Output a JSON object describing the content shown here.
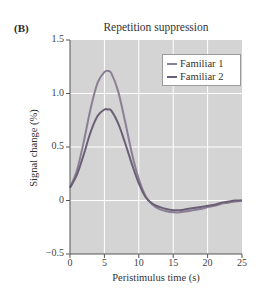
{
  "panel_label": "(B)",
  "chart_data": {
    "type": "line",
    "title": "Repetition suppression",
    "xlabel": "Peristimulus time (s)",
    "ylabel": "Signal change (%)",
    "xlim": [
      0,
      25
    ],
    "ylim": [
      -0.5,
      1.5
    ],
    "x_ticks": [
      0,
      5,
      10,
      15,
      20,
      25
    ],
    "x_tick_labels": [
      "0",
      "5",
      "10",
      "15",
      "20",
      "25"
    ],
    "y_ticks": [
      -0.5,
      0,
      0.5,
      1.0,
      1.5
    ],
    "y_tick_labels": [
      "−0.5",
      "0",
      "0.5",
      "1.0",
      "1.5"
    ],
    "grid": true,
    "background": "#d4d4d4",
    "grid_color": "#ffffff",
    "legend_position": "upper right",
    "x": [
      0,
      1,
      2,
      3,
      4,
      5,
      5.5,
      6,
      7,
      8,
      9,
      10,
      11,
      12,
      13,
      14,
      15,
      16,
      17,
      18,
      19,
      20,
      21,
      22,
      23,
      24,
      25
    ],
    "series": [
      {
        "name": "Familiar 1",
        "color": "#8a7f94",
        "values": [
          0.12,
          0.28,
          0.55,
          0.86,
          1.1,
          1.2,
          1.21,
          1.19,
          1.02,
          0.74,
          0.44,
          0.2,
          0.04,
          -0.04,
          -0.08,
          -0.1,
          -0.11,
          -0.11,
          -0.1,
          -0.09,
          -0.08,
          -0.06,
          -0.05,
          -0.03,
          -0.02,
          -0.01,
          0.0
        ]
      },
      {
        "name": "Familiar 2",
        "color": "#6b5f77",
        "values": [
          0.12,
          0.24,
          0.43,
          0.64,
          0.79,
          0.85,
          0.85,
          0.84,
          0.72,
          0.54,
          0.34,
          0.16,
          0.03,
          -0.03,
          -0.06,
          -0.08,
          -0.09,
          -0.09,
          -0.08,
          -0.07,
          -0.06,
          -0.05,
          -0.04,
          -0.02,
          -0.01,
          0.0,
          0.0
        ]
      }
    ]
  }
}
